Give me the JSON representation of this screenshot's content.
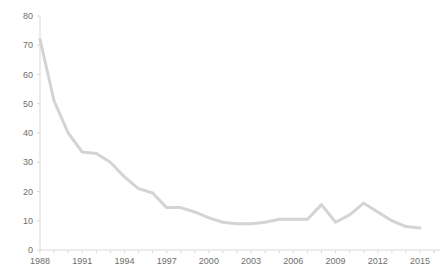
{
  "chart_data": {
    "type": "line",
    "title": "",
    "subtitle": "",
    "xlabel": "",
    "ylabel": "",
    "grid": false,
    "legend": "none",
    "line_color": "#d4d4d4",
    "axis_color": "#d9d9d9",
    "tick_text_color": "#6e6e6e",
    "xlim": [
      1988,
      2015
    ],
    "ylim": [
      0,
      80
    ],
    "y_ticks": [
      0,
      10,
      20,
      30,
      40,
      50,
      60,
      70,
      80
    ],
    "y_tick_labels": [
      "0",
      "10",
      "20",
      "30",
      "40",
      "50",
      "60",
      "70",
      "80"
    ],
    "x_ticks": [
      1988,
      1991,
      1994,
      1997,
      2000,
      2003,
      2006,
      2009,
      2012,
      2015
    ],
    "x_tick_labels": [
      "1988",
      "1991",
      "1994",
      "1997",
      "2000",
      "2003",
      "2006",
      "2009",
      "2012",
      "2015"
    ],
    "x_minor_tick_interval": 1,
    "x": [
      1988,
      1989,
      1990,
      1991,
      1992,
      1993,
      1994,
      1995,
      1996,
      1997,
      1998,
      1999,
      2000,
      2001,
      2002,
      2003,
      2004,
      2005,
      2006,
      2007,
      2008,
      2009,
      2010,
      2011,
      2012,
      2013,
      2014,
      2015
    ],
    "values": [
      72,
      51,
      40,
      33.5,
      33,
      30,
      25,
      21,
      19.5,
      14.5,
      14.5,
      13,
      11,
      9.5,
      9,
      9,
      9.5,
      10.5,
      10.5,
      10.5,
      15.5,
      9.5,
      12,
      16,
      13,
      10,
      8,
      7.5
    ],
    "series": [
      {
        "name": "series-1",
        "values": [
          72,
          51,
          40,
          33.5,
          33,
          30,
          25,
          21,
          19.5,
          14.5,
          14.5,
          13,
          11,
          9.5,
          9,
          9,
          9.5,
          10.5,
          10.5,
          10.5,
          15.5,
          9.5,
          12,
          16,
          13,
          10,
          8,
          7.5
        ]
      }
    ]
  }
}
